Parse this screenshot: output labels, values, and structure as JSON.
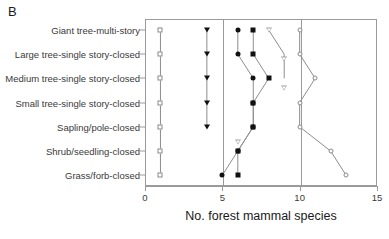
{
  "panel": {
    "label": "B"
  },
  "axes": {
    "x_title": "No. forest mammal species",
    "x_ticks": [
      "0",
      "5",
      "10",
      "15"
    ],
    "x_tick_values": [
      0,
      5,
      10,
      15
    ],
    "y_categories": [
      "Giant tree-multi-story",
      "Large  tree-single story-closed",
      "Medium  tree-single story-closed",
      "Small tree-single story-closed",
      "Sapling/pole-closed",
      "Shrub/seedling-closed",
      "Grass/forb-closed"
    ]
  },
  "colors": {
    "frame": "#9a9a9a",
    "line": "#8d8d8d",
    "filled_marker": "#111111",
    "open_marker_edge": "#8a8a8a",
    "text": "#2b2b2b"
  },
  "chart_data": {
    "type": "line",
    "title": "",
    "subtitle": "",
    "xlabel": "No. forest mammal species",
    "ylabel": "",
    "xlim": [
      0,
      15
    ],
    "grid": "vertical lines at x=5 and x=10",
    "legend": "none",
    "orientation": "horizontal (categories on y-axis)",
    "categories": [
      "Giant tree-multi-story",
      "Large  tree-single story-closed",
      "Medium  tree-single story-closed",
      "Small tree-single story-closed",
      "Sapling/pole-closed",
      "Shrub/seedling-closed",
      "Grass/forb-closed"
    ],
    "series": [
      {
        "name": "open-square-series",
        "marker": "open-square",
        "values": [
          1,
          1,
          1,
          1,
          1,
          1,
          1
        ]
      },
      {
        "name": "filled-triangle-series",
        "marker": "filled-triangle-down",
        "values": [
          4,
          4,
          4,
          4,
          4,
          null,
          null
        ]
      },
      {
        "name": "filled-circle-series",
        "marker": "filled-circle",
        "values": [
          6,
          6,
          7,
          7,
          7,
          6,
          5
        ]
      },
      {
        "name": "filled-square-series",
        "marker": "filled-square",
        "values": [
          7,
          7,
          8,
          7,
          7,
          6,
          6
        ]
      },
      {
        "name": "open-triangle-series",
        "marker": "open-triangle-down",
        "values": [
          8,
          9,
          9,
          null,
          6,
          null,
          null
        ]
      },
      {
        "name": "open-circle-series",
        "marker": "open-circle",
        "values": [
          10,
          10,
          11,
          10,
          10,
          12,
          13
        ]
      }
    ]
  }
}
